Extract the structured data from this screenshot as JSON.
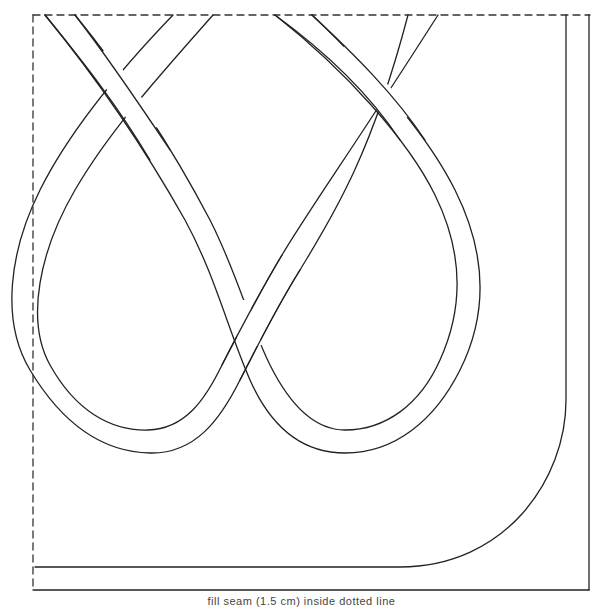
{
  "diagram": {
    "stroke_color": "#222222",
    "background": "#ffffff",
    "frame": {
      "top_edge": "dashed",
      "left_edge": "dashed",
      "right_edge": "solid",
      "bottom_edge": "solid",
      "left": 33,
      "top": 15,
      "right": 590,
      "bottom": 590
    },
    "elements": [
      {
        "name": "left-loop",
        "type": "band-loop"
      },
      {
        "name": "right-loop",
        "type": "band-loop"
      },
      {
        "name": "upper-left-crossing",
        "type": "over-under"
      },
      {
        "name": "upper-right-crossing",
        "type": "over-under"
      },
      {
        "name": "center-crossing",
        "type": "over-under"
      },
      {
        "name": "corner-band",
        "type": "curved-band"
      }
    ]
  },
  "caption": {
    "text": "fill seam (1.5 cm) inside dotted line"
  }
}
